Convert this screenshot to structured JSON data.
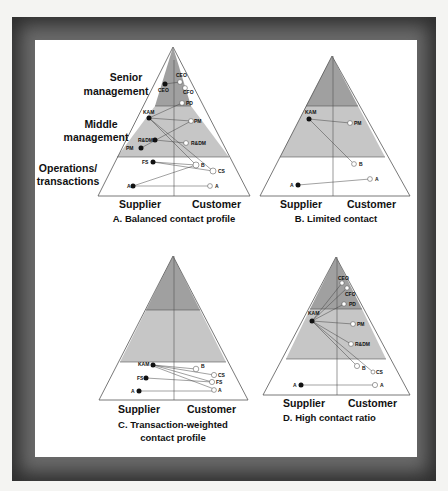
{
  "colors": {
    "senior_band": "#a0a0a0",
    "middle_band": "#c6c6c6",
    "ops_band": "#ffffff",
    "outline": "#555555",
    "node_fill_supplier": "#111111",
    "node_fill_customer": "#ffffff"
  },
  "layer_labels": [
    {
      "line1": "Senior",
      "line2": "management"
    },
    {
      "line1": "Middle",
      "line2": "management"
    },
    {
      "line1": "Operations/",
      "line2": "transactions"
    }
  ],
  "panels": [
    {
      "id": "A",
      "caption_line1": "A. Balanced contact profile",
      "caption_line2": "",
      "supplier_label": "Supplier",
      "customer_label": "Customer"
    },
    {
      "id": "B",
      "caption_line1": "B. Limited contact",
      "caption_line2": "",
      "supplier_label": "Supplier",
      "customer_label": "Customer"
    },
    {
      "id": "C",
      "caption_line1": "C. Transaction-weighted",
      "caption_line2": "contact profile",
      "supplier_label": "Supplier",
      "customer_label": "Customer"
    },
    {
      "id": "D",
      "caption_line1": "D. High contact ratio",
      "caption_line2": "",
      "supplier_label": "Supplier",
      "customer_label": "Customer"
    }
  ],
  "diagram_data": {
    "A": {
      "supplier_nodes": [
        "CEO",
        "KAM",
        "R&DM",
        "PM",
        "FS",
        "A"
      ],
      "customer_nodes": [
        "CEO",
        "CFO",
        "PD",
        "PM",
        "R&DM",
        "B",
        "CS",
        "A"
      ],
      "links": [
        [
          "CEO",
          "CEO"
        ],
        [
          "KAM",
          "PD"
        ],
        [
          "KAM",
          "PM"
        ],
        [
          "KAM",
          "B"
        ],
        [
          "KAM",
          "CS"
        ],
        [
          "R&DM",
          "R&DM"
        ],
        [
          "PM",
          "PM"
        ],
        [
          "FS",
          "B"
        ],
        [
          "FS",
          "CS"
        ],
        [
          "A",
          "B"
        ],
        [
          "A",
          "A"
        ]
      ]
    },
    "B": {
      "supplier_nodes": [
        "KAM",
        "A"
      ],
      "customer_nodes": [
        "PM",
        "B",
        "A"
      ],
      "links": [
        [
          "KAM",
          "PM"
        ],
        [
          "KAM",
          "B"
        ],
        [
          "A",
          "A"
        ]
      ]
    },
    "C": {
      "supplier_nodes": [
        "KAM",
        "FS",
        "A"
      ],
      "customer_nodes": [
        "B",
        "CS",
        "FS",
        "A"
      ],
      "links": [
        [
          "KAM",
          "B"
        ],
        [
          "KAM",
          "CS"
        ],
        [
          "KAM",
          "FS"
        ],
        [
          "KAM",
          "A"
        ],
        [
          "FS",
          "FS"
        ],
        [
          "A",
          "A"
        ]
      ]
    },
    "D": {
      "supplier_nodes": [
        "KAM",
        "A"
      ],
      "customer_nodes": [
        "CEO",
        "CFO",
        "PD",
        "PM",
        "R&DM",
        "B",
        "CS"
      ],
      "links": [
        [
          "KAM",
          "CEO"
        ],
        [
          "KAM",
          "CFO"
        ],
        [
          "KAM",
          "PD"
        ],
        [
          "KAM",
          "PM"
        ],
        [
          "KAM",
          "R&DM"
        ],
        [
          "KAM",
          "B"
        ],
        [
          "KAM",
          "CS"
        ],
        [
          "A",
          "A"
        ]
      ]
    }
  }
}
